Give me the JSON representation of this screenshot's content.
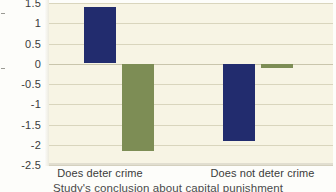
{
  "chart_data": {
    "type": "bar",
    "title": "",
    "subtitle": "",
    "xlabel": "Study's conclusion about capital punishment",
    "ylabel": "",
    "categories": [
      "Does deter crime",
      "Does not deter crime"
    ],
    "series": [
      {
        "name": "series-navy",
        "color": "#222c6e",
        "values": [
          1.39,
          -1.9
        ]
      },
      {
        "name": "series-olive",
        "color": "#7d8d55",
        "values": [
          -2.15,
          -0.1
        ]
      }
    ],
    "ylim": [
      -2.5,
      1.5
    ],
    "yticks": [
      1.5,
      1,
      0.5,
      0,
      -0.5,
      -1,
      -1.5,
      -2,
      -2.5
    ],
    "ytick_labels": [
      "1.5",
      "1",
      "0.5",
      "0",
      "-0.5",
      "-1",
      "-1.5",
      "-2",
      "-2.5"
    ],
    "grid": true,
    "legend": "none",
    "plot_background": "#f7f4e4",
    "gridline_color": "#d9d5bd"
  },
  "axes": {
    "y_tick_labels": [
      "1.5",
      "1",
      "0.5",
      "0",
      "-0.5",
      "-1",
      "-1.5",
      "-2",
      "-2.5"
    ],
    "x_tick_labels": [
      "Does deter crime",
      "Does not deter crime"
    ],
    "x_axis_title": "Study's conclusion about capital punishment"
  }
}
